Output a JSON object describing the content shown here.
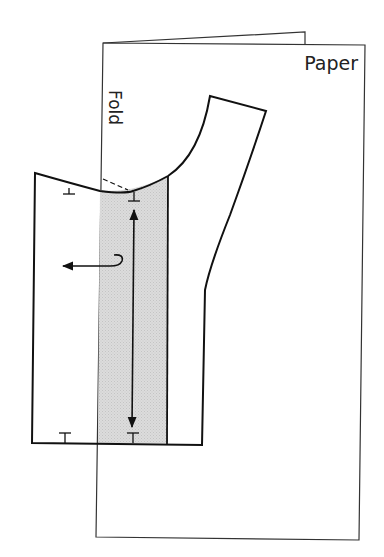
{
  "diagram": {
    "labels": {
      "paper": "Paper",
      "fold": "Fold"
    },
    "colors": {
      "line": "#111111",
      "paper_line": "#333333",
      "shaded_band": "#d4d4d4",
      "background": "#ffffff"
    },
    "elements": {
      "paper_sheet": "folded paper",
      "pattern_piece": "bodice pattern",
      "shaded_band": "overlap band",
      "grainline_arrow": "double-headed vertical arrow",
      "direction_arrow": "curled arrow pointing left",
      "dashed_line": "neckline extension"
    }
  }
}
